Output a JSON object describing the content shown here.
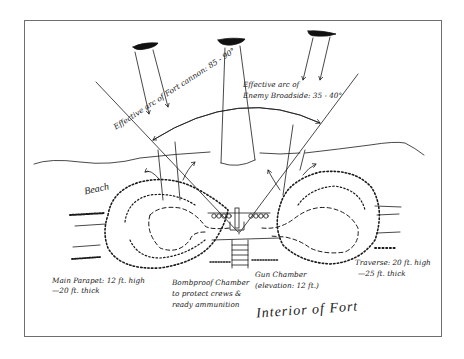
{
  "diagram": {
    "title": "Interior of Fort",
    "beach_label": "Beach",
    "labels": {
      "fort_cannon_arc": "Effective arc of Fort cannon: 85 - 90°",
      "enemy_broadside_arc_line1": "Effective arc of",
      "enemy_broadside_arc_line2": "Enemy Broadside: 35 - 40°",
      "main_parapet_line1": "Main Parapet: 12 ft. high",
      "main_parapet_line2": "—20 ft. thick",
      "bombproof_line1": "Bombproof Chamber",
      "bombproof_line2": "to protect crews &",
      "bombproof_line3": "ready ammunition",
      "gun_chamber_line1": "Gun Chamber",
      "gun_chamber_line2": "(elevation: 12 ft.)",
      "traverse_line1": "Traverse: 20 ft. high",
      "traverse_line2": "—25 ft. thick"
    },
    "elements": {
      "enemy_ships": 3,
      "colors": {
        "ink": "#1a1a1a",
        "frame": "#6e6e6e",
        "background": "#ffffff"
      }
    }
  }
}
